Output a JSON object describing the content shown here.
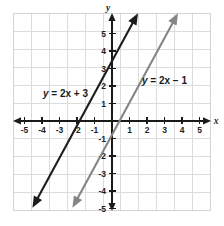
{
  "figure": {
    "background_color": "#ffffff",
    "grid_color": "#dcdcdc",
    "axis_color": "#1a1a1a"
  },
  "axes": {
    "x_name": "x",
    "y_name": "y",
    "x_ticks": [
      -5,
      -4,
      -3,
      -2,
      -1,
      1,
      2,
      3,
      4,
      5
    ],
    "y_ticks": [
      5,
      4,
      3,
      2,
      1,
      -1,
      -2,
      -3,
      -4,
      -5
    ],
    "xlim": [
      -5.7,
      5.7
    ],
    "ylim": [
      -5.7,
      5.7
    ]
  },
  "chart_data": {
    "type": "line",
    "title": "",
    "xlabel": "x",
    "ylabel": "y",
    "xlim": [
      -5.7,
      5.7
    ],
    "ylim": [
      -5.7,
      5.7
    ],
    "grid": true,
    "legend": "inline-annotations",
    "series": [
      {
        "name": "y = 2x + 3",
        "label_text": "y = 2x + 3",
        "color": "#1c1c1c",
        "slope": 2,
        "intercept": 3,
        "x_intercept": -1.5,
        "y_intercept": 3,
        "arrows": "both",
        "x_range": [
          -4.3,
          1.5
        ],
        "points": [
          {
            "x": -4.3,
            "y": -5.6
          },
          {
            "x": -1.5,
            "y": 0
          },
          {
            "x": 0,
            "y": 3
          },
          {
            "x": 1.5,
            "y": 6
          }
        ]
      },
      {
        "name": "y = 2x - 1",
        "label_text": "y = 2x − 1",
        "color": "#858585",
        "slope": 2,
        "intercept": -1,
        "x_intercept": 0.5,
        "y_intercept": -1,
        "arrows": "both",
        "x_range": [
          -2.3,
          3.5
        ],
        "points": [
          {
            "x": -2.3,
            "y": -5.6
          },
          {
            "x": 0,
            "y": -1
          },
          {
            "x": 0.5,
            "y": 0
          },
          {
            "x": 3.5,
            "y": 6
          }
        ]
      }
    ],
    "annotations": [
      {
        "text": "y = 2x + 3",
        "x": -3.1,
        "y": 1.55,
        "color": "#1a1a1a"
      },
      {
        "text": "y = 2x − 1",
        "x": 2.45,
        "y": 2.3,
        "color": "#1a1a1a"
      }
    ]
  }
}
